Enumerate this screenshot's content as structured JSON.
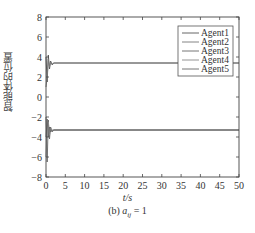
{
  "chart_data": {
    "type": "line",
    "title": "",
    "xlabel": "t/s",
    "ylabel": "智能体的位置",
    "caption": "(b) a_ij = 1",
    "caption_prefix": "(b)",
    "caption_var": "a",
    "caption_sub": "ij",
    "caption_rhs": "= 1",
    "xlim": [
      0,
      50
    ],
    "ylim": [
      -8,
      8
    ],
    "xticks": [
      0,
      5,
      10,
      15,
      20,
      25,
      30,
      35,
      40,
      45,
      50
    ],
    "yticks": [
      -8,
      -6,
      -4,
      -2,
      0,
      2,
      4,
      6,
      8
    ],
    "grid": false,
    "legend_position": "upper right",
    "legend": [
      "Agent1",
      "Agent2",
      "Agent3",
      "Agent4",
      "Agent5"
    ],
    "series": [
      {
        "name": "Agent1",
        "x": [
          0,
          0.3,
          0.6,
          0.9,
          1.2,
          1.6,
          2.0,
          50
        ],
        "values": [
          4.0,
          1.5,
          4.2,
          2.8,
          3.6,
          3.2,
          3.4,
          3.4
        ]
      },
      {
        "name": "Agent2",
        "x": [
          0,
          0.3,
          0.6,
          0.9,
          1.2,
          1.6,
          2.0,
          50
        ],
        "values": [
          1.0,
          2.0,
          3.8,
          3.0,
          3.5,
          3.3,
          3.4,
          3.4
        ]
      },
      {
        "name": "Agent3",
        "x": [
          0,
          0.3,
          0.6,
          0.9,
          1.2,
          1.6,
          2.0,
          50
        ],
        "values": [
          -2.0,
          -6.5,
          -2.3,
          -4.2,
          -3.0,
          -3.5,
          -3.3,
          -3.3
        ]
      },
      {
        "name": "Agent4",
        "x": [
          0,
          0.3,
          0.6,
          0.9,
          1.2,
          1.6,
          2.0,
          50
        ],
        "values": [
          -6.0,
          -3.0,
          -2.5,
          -3.8,
          -3.1,
          -3.4,
          -3.3,
          -3.3
        ]
      },
      {
        "name": "Agent5",
        "x": [
          0,
          0.3,
          0.6,
          0.9,
          1.2,
          1.6,
          2.0,
          50
        ],
        "values": [
          -4.0,
          -2.2,
          -4.0,
          -3.0,
          -3.5,
          -3.3,
          -3.3,
          -3.3
        ]
      }
    ],
    "colors": [
      "#555555",
      "#777777",
      "#666666",
      "#888888",
      "#666666"
    ]
  }
}
